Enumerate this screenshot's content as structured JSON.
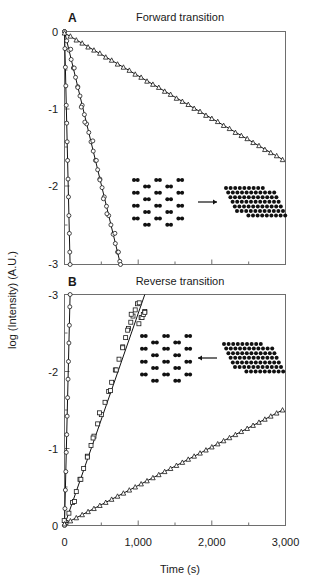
{
  "figure": {
    "xlabel": "Time (s)",
    "ylabel": "log  (Intensity) (A.U.)"
  },
  "panels": [
    {
      "id": "A",
      "letter": "A",
      "title": "Forward transition",
      "inset": {
        "arrow_direction": "right",
        "left_shape": "honeycomb-lattice",
        "right_shape": "dense-cluster"
      }
    },
    {
      "id": "B",
      "letter": "B",
      "title": "Reverse transition",
      "inset": {
        "arrow_direction": "left",
        "left_shape": "honeycomb-lattice",
        "right_shape": "dense-cluster"
      }
    }
  ],
  "chart_data": [
    {
      "type": "scatter",
      "panel": "A",
      "title": "Forward transition",
      "xlabel": "Time (s)",
      "ylabel": "log (Intensity) (A.U.)",
      "xlim": [
        0,
        3000
      ],
      "ylim": [
        -3,
        0
      ],
      "xticks": [
        0,
        1000,
        2000,
        3000
      ],
      "xticklabels": [
        "0",
        "1,000",
        "2,000",
        "3,000"
      ],
      "xminorticks": [
        500,
        1500,
        2500
      ],
      "yticks": [
        0,
        -1,
        -2,
        -3
      ],
      "yticklabels": [
        "0",
        "-1",
        "-2",
        "-3"
      ],
      "grid": false,
      "legend": "none",
      "series": [
        {
          "name": "fastest-decay-circles",
          "marker": "circle-open",
          "fit_slope_per_s": -0.0395,
          "fit_intercept": 0.0,
          "x": [
            0,
            6,
            12,
            18,
            24,
            30,
            36,
            42,
            48,
            54,
            60,
            66,
            72,
            76
          ],
          "y": [
            0.0,
            -0.22,
            -0.46,
            -0.7,
            -0.95,
            -1.18,
            -1.42,
            -1.66,
            -1.9,
            -2.13,
            -2.37,
            -2.6,
            -2.84,
            -3.0
          ]
        },
        {
          "name": "intermediate-decay-circles",
          "marker": "circle-open",
          "fit_slope_per_s": -0.00395,
          "fit_intercept": 0.0,
          "x": [
            0,
            30,
            60,
            90,
            120,
            150,
            180,
            210,
            240,
            270,
            300,
            330,
            360,
            390,
            420,
            450,
            480,
            510,
            540,
            570,
            600,
            630,
            660,
            690,
            720,
            750,
            760
          ],
          "y": [
            0.0,
            -0.12,
            -0.24,
            -0.36,
            -0.47,
            -0.59,
            -0.71,
            -0.83,
            -0.95,
            -1.07,
            -1.19,
            -1.3,
            -1.42,
            -1.54,
            -1.66,
            -1.78,
            -1.9,
            -2.01,
            -2.13,
            -2.25,
            -2.37,
            -2.49,
            -2.61,
            -2.73,
            -2.84,
            -2.96,
            -3.0
          ]
        },
        {
          "name": "slow-decay-triangles",
          "marker": "triangle-open",
          "fit_slope_per_s": -0.00055,
          "fit_intercept": -0.02,
          "x": [
            0,
            80,
            160,
            240,
            320,
            400,
            480,
            560,
            640,
            720,
            800,
            880,
            960,
            1040,
            1120,
            1200,
            1280,
            1360,
            1440,
            1520,
            1600,
            1680,
            1760,
            1840,
            1920,
            2000,
            2080,
            2160,
            2240,
            2320,
            2400,
            2480,
            2560,
            2640,
            2720,
            2800,
            2880,
            2960
          ],
          "y": [
            -0.02,
            -0.06,
            -0.11,
            -0.15,
            -0.2,
            -0.24,
            -0.28,
            -0.33,
            -0.37,
            -0.42,
            -0.46,
            -0.5,
            -0.55,
            -0.59,
            -0.64,
            -0.68,
            -0.72,
            -0.77,
            -0.81,
            -0.86,
            -0.9,
            -0.94,
            -0.99,
            -1.03,
            -1.08,
            -1.12,
            -1.16,
            -1.21,
            -1.25,
            -1.3,
            -1.34,
            -1.38,
            -1.43,
            -1.47,
            -1.52,
            -1.56,
            -1.6,
            -1.65
          ]
        }
      ]
    },
    {
      "type": "scatter",
      "panel": "B",
      "title": "Reverse transition",
      "xlabel": "Time (s)",
      "ylabel": "log (Intensity) (A.U.)",
      "xlim": [
        0,
        3000
      ],
      "ylim": [
        0,
        -3
      ],
      "xticks": [
        0,
        1000,
        2000,
        3000
      ],
      "xticklabels": [
        "0",
        "1,000",
        "2,000",
        "3,000"
      ],
      "xminorticks": [
        500,
        1500,
        2500
      ],
      "yticks": [
        -3,
        -2,
        -1,
        0
      ],
      "yticklabels": [
        "-3",
        "-2",
        "-1",
        "0"
      ],
      "grid": false,
      "legend": "none",
      "series": [
        {
          "name": "fastest-rise-circles",
          "marker": "circle-open",
          "fit_slope_per_s": -0.0395,
          "fit_intercept": 0.0,
          "x": [
            0,
            6,
            12,
            18,
            24,
            30,
            36,
            42,
            48,
            54,
            60,
            66,
            72,
            76
          ],
          "y": [
            0.0,
            -0.22,
            -0.46,
            -0.7,
            -0.95,
            -1.18,
            -1.42,
            -1.66,
            -1.9,
            -2.13,
            -2.37,
            -2.6,
            -2.84,
            -3.0
          ]
        },
        {
          "name": "intermediate-rise-squares",
          "marker": "square-open",
          "fit_slope_per_s": -0.00295,
          "fit_intercept": 0.0,
          "x": [
            20,
            60,
            110,
            160,
            210,
            260,
            310,
            360,
            400,
            450,
            500,
            550,
            600,
            640,
            690,
            740,
            790,
            830,
            870,
            900,
            930,
            960,
            990,
            1010,
            1040,
            1070,
            1090
          ],
          "y": [
            -0.04,
            -0.16,
            -0.3,
            -0.44,
            -0.6,
            -0.74,
            -0.9,
            -1.04,
            -1.16,
            -1.32,
            -1.44,
            -1.6,
            -1.74,
            -1.86,
            -2.02,
            -2.16,
            -2.32,
            -2.44,
            -2.56,
            -2.64,
            -2.72,
            -2.8,
            -2.88,
            -2.62,
            -2.7,
            -2.74,
            -2.78
          ]
        },
        {
          "name": "slow-rise-triangles-squares",
          "marker": "triangle-open",
          "fit_slope_per_s": -0.0005,
          "fit_intercept": -0.02,
          "x": [
            0,
            80,
            160,
            240,
            320,
            400,
            480,
            560,
            640,
            720,
            800,
            880,
            960,
            1040,
            1120,
            1200,
            1280,
            1360,
            1440,
            1520,
            1600,
            1680,
            1760,
            1840,
            1920,
            2000,
            2080,
            2160,
            2240,
            2320,
            2400,
            2480,
            2560,
            2640,
            2720,
            2800,
            2880,
            2960
          ],
          "y": [
            -0.02,
            -0.06,
            -0.1,
            -0.14,
            -0.18,
            -0.22,
            -0.26,
            -0.3,
            -0.34,
            -0.38,
            -0.42,
            -0.46,
            -0.5,
            -0.54,
            -0.58,
            -0.62,
            -0.66,
            -0.7,
            -0.74,
            -0.78,
            -0.82,
            -0.86,
            -0.9,
            -0.94,
            -0.98,
            -1.02,
            -1.06,
            -1.1,
            -1.14,
            -1.18,
            -1.22,
            -1.26,
            -1.3,
            -1.34,
            -1.38,
            -1.42,
            -1.46,
            -1.5
          ]
        }
      ]
    }
  ]
}
